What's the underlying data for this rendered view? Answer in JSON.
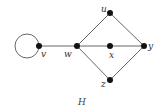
{
  "graph": {
    "title": "H",
    "edge_color": "#555555",
    "node_color": "#111111",
    "nodes": [
      {
        "id": "v",
        "label": "v"
      },
      {
        "id": "w",
        "label": "w"
      },
      {
        "id": "u",
        "label": "u"
      },
      {
        "id": "x",
        "label": "x"
      },
      {
        "id": "y",
        "label": "y"
      },
      {
        "id": "z",
        "label": "z"
      }
    ],
    "edges": [
      [
        "v",
        "v"
      ],
      [
        "v",
        "w"
      ],
      [
        "w",
        "u"
      ],
      [
        "w",
        "x"
      ],
      [
        "x",
        "y"
      ],
      [
        "w",
        "z"
      ],
      [
        "u",
        "y"
      ],
      [
        "z",
        "y"
      ]
    ]
  }
}
